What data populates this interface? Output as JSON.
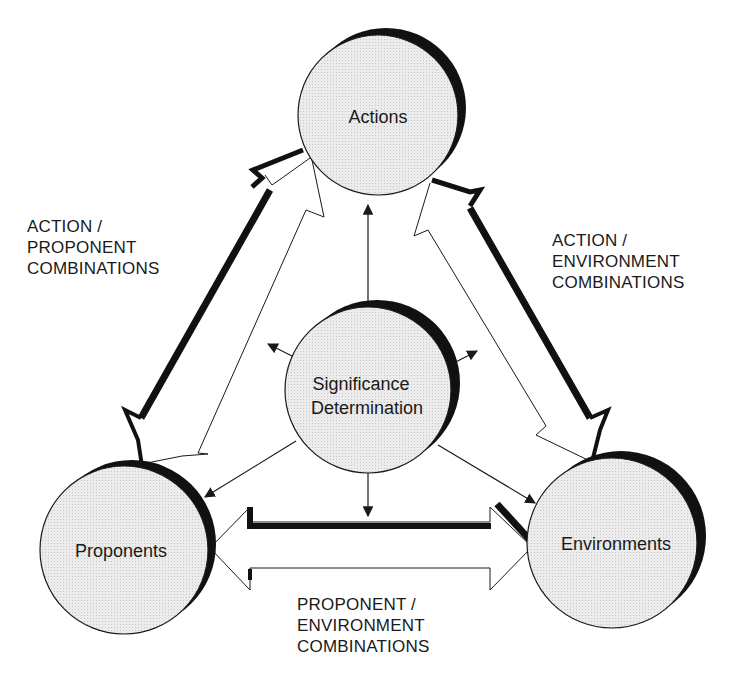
{
  "diagram": {
    "nodes": {
      "actions": {
        "label": "Actions",
        "cx": 378,
        "cy": 115,
        "r": 80
      },
      "significance": {
        "line1": "Significance",
        "line2": "Determination",
        "cx": 368,
        "cy": 390,
        "r": 83
      },
      "proponents": {
        "label": "Proponents",
        "cx": 124,
        "cy": 550,
        "r": 84
      },
      "environments": {
        "label": "Environments",
        "cx": 612,
        "cy": 543,
        "r": 85
      }
    },
    "edges": {
      "action_proponent": {
        "line1": "ACTION /",
        "line2": "PROPONENT",
        "line3": "COMBINATIONS"
      },
      "action_environment": {
        "line1": "ACTION /",
        "line2": "ENVIRONMENT",
        "line3": "COMBINATIONS"
      },
      "proponent_environment": {
        "line1": "PROPONENT /",
        "line2": "ENVIRONMENT",
        "line3": "COMBINATIONS"
      }
    },
    "colors": {
      "node_fill": "#e6e6e6",
      "stroke": "#1a1a1a",
      "shadow": "#111111",
      "background": "#ffffff"
    }
  }
}
